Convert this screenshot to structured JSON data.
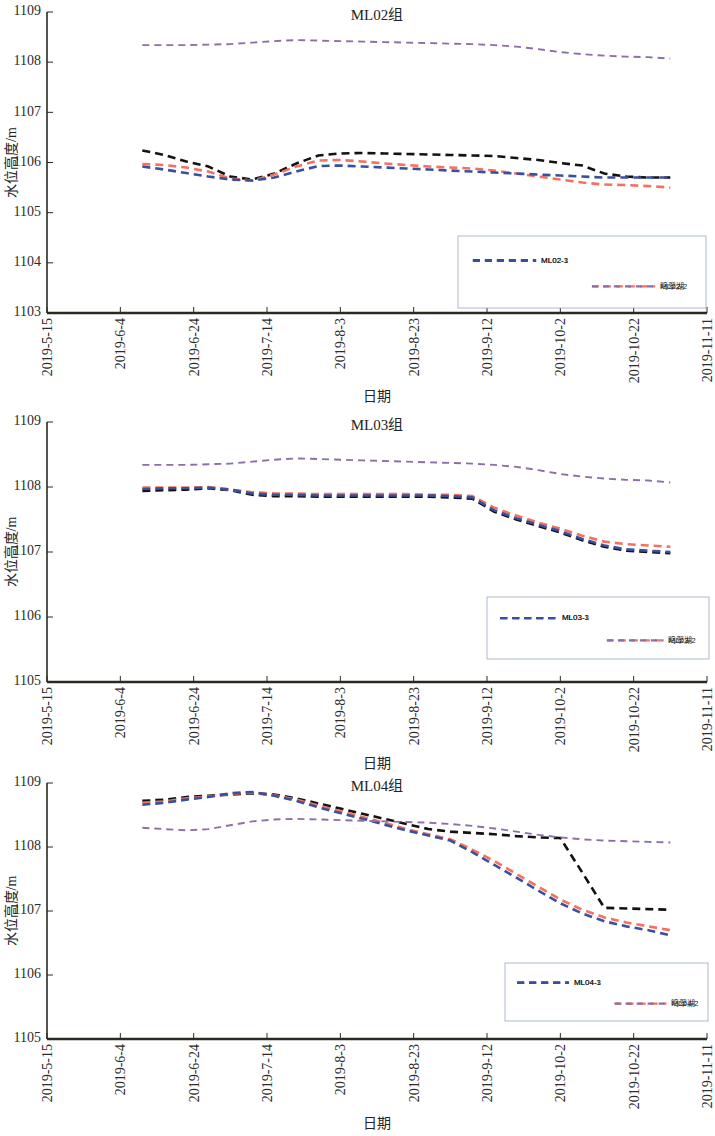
{
  "figure": {
    "panel_count": 3,
    "xlabel": "日期",
    "ylabel": "水位高度/m",
    "lake_label": "鸣翠湖",
    "colors": {
      "series1": "#121212",
      "series2": "#f4715f",
      "series3": "#3b4fa0",
      "lake": "#8d6fa8",
      "axis": "#2a2a22",
      "legend_border": "#9aa8c4"
    },
    "x_tick_labels": [
      "2019-5-15",
      "2019-6-4",
      "2019-6-24",
      "2019-7-14",
      "2019-8-3",
      "2019-8-23",
      "2019-9-12",
      "2019-10-2",
      "2019-10-22",
      "2019-11-11"
    ]
  },
  "chart_data": [
    {
      "type": "line",
      "title": "ML02组",
      "xlabel": "日期",
      "ylabel": "水位高度/m",
      "grid": false,
      "legend_position": "lower-right",
      "xlim": [
        "2019-5-15",
        "2019-11-11"
      ],
      "ylim": [
        1103,
        1109
      ],
      "ytick_labels": [
        "1103",
        "1104",
        "1105",
        "1106",
        "1107",
        "1108",
        "1109"
      ],
      "ytick_values": [
        1103,
        1104,
        1105,
        1106,
        1107,
        1108,
        1109
      ],
      "xtick_labels": [
        "2019-5-15",
        "2019-6-4",
        "2019-6-24",
        "2019-7-14",
        "2019-8-3",
        "2019-8-23",
        "2019-9-12",
        "2019-10-2",
        "2019-10-22",
        "2019-11-11"
      ],
      "x": [
        26,
        32,
        38,
        44,
        50,
        56,
        62,
        68,
        74,
        80,
        86,
        92,
        98,
        104,
        110,
        116,
        122,
        128,
        134,
        140,
        146,
        152,
        158,
        164,
        170
      ],
      "series": [
        {
          "name": "ML02-1",
          "color": "#121212",
          "values": [
            1106.24,
            1106.15,
            1106.02,
            1105.92,
            1105.72,
            1105.66,
            1105.78,
            1105.98,
            1106.14,
            1106.18,
            1106.19,
            1106.18,
            1106.17,
            1106.16,
            1106.15,
            1106.14,
            1106.13,
            1106.09,
            1106.05,
            1105.99,
            1105.94,
            1105.78,
            1105.72,
            1105.7,
            1105.7
          ]
        },
        {
          "name": "ML02-2",
          "color": "#f4715f",
          "values": [
            1105.97,
            1105.95,
            1105.9,
            1105.82,
            1105.68,
            1105.64,
            1105.76,
            1105.92,
            1106.04,
            1106.05,
            1106.02,
            1105.98,
            1105.95,
            1105.92,
            1105.9,
            1105.88,
            1105.84,
            1105.78,
            1105.72,
            1105.66,
            1105.6,
            1105.56,
            1105.55,
            1105.53,
            1105.5
          ]
        },
        {
          "name": "ML02-3",
          "color": "#3b4fa0",
          "values": [
            1105.92,
            1105.86,
            1105.79,
            1105.72,
            1105.66,
            1105.64,
            1105.7,
            1105.82,
            1105.93,
            1105.94,
            1105.92,
            1105.9,
            1105.88,
            1105.86,
            1105.84,
            1105.82,
            1105.8,
            1105.78,
            1105.76,
            1105.74,
            1105.72,
            1105.7,
            1105.7,
            1105.7,
            1105.7
          ]
        },
        {
          "name": "鸣翠湖",
          "color": "#8d6fa8",
          "values": [
            1108.34,
            1108.34,
            1108.34,
            1108.35,
            1108.36,
            1108.39,
            1108.42,
            1108.44,
            1108.43,
            1108.42,
            1108.41,
            1108.4,
            1108.39,
            1108.38,
            1108.37,
            1108.36,
            1108.34,
            1108.31,
            1108.26,
            1108.2,
            1108.16,
            1108.13,
            1108.11,
            1108.1,
            1108.07
          ]
        }
      ]
    },
    {
      "type": "line",
      "title": "ML03组",
      "xlabel": "日期",
      "ylabel": "水位高度/m",
      "grid": false,
      "legend_position": "lower-right",
      "xlim": [
        "2019-5-15",
        "2019-11-11"
      ],
      "ylim": [
        1105,
        1109
      ],
      "ytick_labels": [
        "1105",
        "1106",
        "1107",
        "1108",
        "1109"
      ],
      "ytick_values": [
        1105,
        1106,
        1107,
        1108,
        1109
      ],
      "xtick_labels": [
        "2019-5-15",
        "2019-6-4",
        "2019-6-24",
        "2019-7-14",
        "2019-8-3",
        "2019-8-23",
        "2019-9-12",
        "2019-10-2",
        "2019-10-22",
        "2019-11-11"
      ],
      "x": [
        26,
        32,
        38,
        44,
        50,
        56,
        62,
        68,
        74,
        80,
        86,
        92,
        98,
        104,
        110,
        116,
        122,
        128,
        134,
        140,
        146,
        152,
        158,
        164,
        170
      ],
      "series": [
        {
          "name": "ML03-1",
          "color": "#121212",
          "values": [
            1107.94,
            1107.95,
            1107.96,
            1107.98,
            1107.95,
            1107.88,
            1107.86,
            1107.86,
            1107.85,
            1107.85,
            1107.85,
            1107.85,
            1107.85,
            1107.85,
            1107.84,
            1107.82,
            1107.62,
            1107.5,
            1107.4,
            1107.3,
            1107.18,
            1107.08,
            1107.02,
            1107.0,
            1106.98
          ]
        },
        {
          "name": "ML03-2",
          "color": "#f4715f",
          "values": [
            1107.99,
            1107.99,
            1107.99,
            1108.0,
            1107.96,
            1107.92,
            1107.9,
            1107.9,
            1107.89,
            1107.89,
            1107.89,
            1107.89,
            1107.89,
            1107.88,
            1107.88,
            1107.86,
            1107.68,
            1107.56,
            1107.45,
            1107.36,
            1107.25,
            1107.16,
            1107.12,
            1107.1,
            1107.08
          ]
        },
        {
          "name": "ML03-3",
          "color": "#3b4fa0",
          "values": [
            1107.97,
            1107.98,
            1107.98,
            1107.99,
            1107.96,
            1107.9,
            1107.88,
            1107.88,
            1107.87,
            1107.87,
            1107.87,
            1107.87,
            1107.87,
            1107.87,
            1107.86,
            1107.84,
            1107.64,
            1107.52,
            1107.42,
            1107.32,
            1107.2,
            1107.1,
            1107.04,
            1107.02,
            1107.0
          ]
        },
        {
          "name": "鸣翠湖",
          "color": "#8d6fa8",
          "values": [
            1108.34,
            1108.34,
            1108.34,
            1108.35,
            1108.36,
            1108.39,
            1108.42,
            1108.44,
            1108.43,
            1108.42,
            1108.41,
            1108.4,
            1108.39,
            1108.38,
            1108.37,
            1108.36,
            1108.34,
            1108.31,
            1108.26,
            1108.2,
            1108.16,
            1108.13,
            1108.11,
            1108.1,
            1108.07
          ]
        }
      ]
    },
    {
      "type": "line",
      "title": "ML04组",
      "xlabel": "日期",
      "ylabel": "水位高度/m",
      "grid": false,
      "legend_position": "lower-right",
      "xlim": [
        "2019-5-15",
        "2019-11-11"
      ],
      "ylim": [
        1105,
        1109
      ],
      "ytick_labels": [
        "1105",
        "1106",
        "1107",
        "1108",
        "1109"
      ],
      "ytick_values": [
        1105,
        1106,
        1107,
        1108,
        1109
      ],
      "xtick_labels": [
        "2019-5-15",
        "2019-6-4",
        "2019-6-24",
        "2019-7-14",
        "2019-8-3",
        "2019-8-23",
        "2019-9-12",
        "2019-10-2",
        "2019-10-22",
        "2019-11-11"
      ],
      "x": [
        26,
        32,
        38,
        44,
        50,
        56,
        62,
        68,
        74,
        80,
        86,
        92,
        98,
        104,
        110,
        116,
        122,
        128,
        134,
        140,
        146,
        152,
        158,
        164,
        170
      ],
      "series": [
        {
          "name": "ML04-1",
          "color": "#121212",
          "values": [
            1108.72,
            1108.74,
            1108.78,
            1108.8,
            1108.82,
            1108.84,
            1108.82,
            1108.76,
            1108.68,
            1108.6,
            1108.52,
            1108.44,
            1108.36,
            1108.28,
            1108.24,
            1108.22,
            1108.2,
            1108.17,
            1108.15,
            1108.14,
            1107.6,
            1107.05,
            1107.04,
            1107.03,
            1107.02
          ]
        },
        {
          "name": "ML04-2",
          "color": "#f4715f",
          "values": [
            1108.69,
            1108.71,
            1108.76,
            1108.79,
            1108.83,
            1108.85,
            1108.81,
            1108.74,
            1108.65,
            1108.56,
            1108.47,
            1108.38,
            1108.28,
            1108.2,
            1108.12,
            1107.96,
            1107.78,
            1107.58,
            1107.38,
            1107.18,
            1107.02,
            1106.9,
            1106.82,
            1106.76,
            1106.7
          ]
        },
        {
          "name": "ML04-3",
          "color": "#3b4fa0",
          "values": [
            1108.66,
            1108.69,
            1108.74,
            1108.78,
            1108.84,
            1108.86,
            1108.8,
            1108.72,
            1108.62,
            1108.53,
            1108.44,
            1108.35,
            1108.26,
            1108.18,
            1108.1,
            1107.92,
            1107.72,
            1107.52,
            1107.32,
            1107.12,
            1106.96,
            1106.84,
            1106.76,
            1106.7,
            1106.62
          ]
        },
        {
          "name": "鸣翠湖",
          "color": "#8d6fa8",
          "values": [
            1108.3,
            1108.28,
            1108.26,
            1108.28,
            1108.34,
            1108.4,
            1108.43,
            1108.44,
            1108.43,
            1108.42,
            1108.41,
            1108.4,
            1108.39,
            1108.38,
            1108.36,
            1108.33,
            1108.29,
            1108.24,
            1108.19,
            1108.15,
            1108.12,
            1108.1,
            1108.09,
            1108.08,
            1108.07
          ]
        }
      ]
    }
  ]
}
